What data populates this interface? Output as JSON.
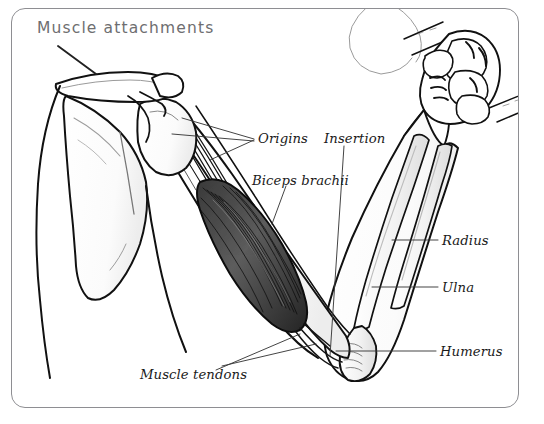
{
  "figure": {
    "title": "Muscle attachments",
    "title_color": "#6e6e70",
    "frame_color": "#8e8e92",
    "background_color": "#ffffff",
    "ink_color": "#111111"
  },
  "annotations": {
    "origins": "Origins",
    "insertion": "Insertion",
    "biceps_brachii": "Biceps brachii",
    "radius": "Radius",
    "ulna": "Ulna",
    "humerus": "Humerus",
    "muscle_tendons": "Muscle tendons"
  },
  "anatomy_parts": [
    "clavicle",
    "scapula",
    "head-outline",
    "torso",
    "deltoid-shoulder",
    "biceps-brachii-muscle",
    "proximal-tendons",
    "distal-tendon",
    "humerus-bone",
    "radius-bone",
    "ulna-bone",
    "forearm",
    "clenched-fist",
    "grip-bar"
  ]
}
